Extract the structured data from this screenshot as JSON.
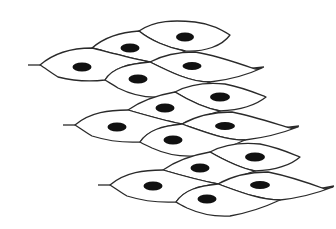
{
  "diagram": {
    "title": "",
    "colors": {
      "background": "#ffffff",
      "outline": "#2a2a2a",
      "nucleus": "#111111"
    },
    "layers": [
      {
        "name": "layer-1",
        "cells": [
          {
            "path": "M139,31 C155,20 175,20 195,22 C212,24 222,30 230,35 C222,46 205,52 185,51 C168,48 150,40 139,31 Z",
            "nucleus": [
              185,
              37,
              9,
              4.5
            ]
          },
          {
            "path": "M92,48 C106,36 122,32 139,31 C150,40 168,48 185,51 C172,58 160,62 150,62 C130,58 108,52 92,48 Z",
            "nucleus": [
              130,
              48,
              9.5,
              4.5
            ]
          },
          {
            "path": "M40,65 C55,52 75,48 92,48 C108,52 130,58 150,62 C128,64 112,68 105,80 C88,82 70,80 58,77 C50,72 45,68 40,65 Z",
            "nucleus": [
              82,
              67,
              9.5,
              4.5
            ]
          },
          {
            "path": "M150,62 C165,54 180,52 195,52 C215,55 235,62 255,69 L262,68 C245,76 228,80 210,82 C190,82 170,72 150,62 Z",
            "nucleus": [
              192,
              66,
              9.5,
              4
            ]
          },
          {
            "path": "M105,80 C112,68 128,64 150,62 C170,72 190,82 210,82 C195,90 178,95 160,97 C145,98 130,94 118,88 C112,84 108,82 105,80 Z",
            "nucleus": [
              138,
              79,
              9.5,
              4.5
            ]
          }
        ],
        "tails": [
          "M28,65 L40,65",
          "M245,69 L264,67"
        ]
      },
      {
        "name": "layer-2",
        "cells": [
          {
            "path": "M175,92 C190,84 205,82 225,84 C245,88 258,94 266,97 C255,106 240,110 220,111 C205,108 188,100 175,92 Z",
            "nucleus": [
              220,
              97,
              10,
              4.5
            ]
          },
          {
            "path": "M128,110 C142,100 158,95 175,92 C188,100 205,108 220,111 C205,116 192,120 182,124 C162,120 145,115 128,110 Z",
            "nucleus": [
              165,
              108,
              9.5,
              4.5
            ]
          },
          {
            "path": "M75,125 C90,112 110,110 128,110 C145,115 162,120 182,124 C165,126 148,130 140,142 C122,143 105,140 92,136 C85,132 80,128 75,125 Z",
            "nucleus": [
              117,
              127,
              9.5,
              4.5
            ]
          },
          {
            "path": "M182,124 C198,115 215,112 232,112 C252,116 270,122 290,128 L298,127 C280,134 262,138 245,140 C225,140 205,132 182,124 Z",
            "nucleus": [
              225,
              126,
              10,
              4
            ]
          },
          {
            "path": "M140,142 C148,130 162,126 182,124 C205,132 225,140 245,140 C228,148 212,153 195,156 C178,157 163,153 152,148 C146,145 143,144 140,142 Z",
            "nucleus": [
              173,
              140,
              9.5,
              4.5
            ]
          }
        ],
        "tails": [
          "M63,125 L75,125",
          "M282,128 L299,126"
        ]
      },
      {
        "name": "layer-3",
        "cells": [
          {
            "path": "M210,152 C225,144 240,142 260,144 C280,148 292,154 300,157 C290,166 275,170 255,171 C240,168 224,160 210,152 Z",
            "nucleus": [
              255,
              157,
              10,
              4.5
            ]
          },
          {
            "path": "M163,170 C177,160 193,155 210,152 C224,160 240,168 255,171 C240,176 228,180 218,184 C198,180 180,175 163,170 Z",
            "nucleus": [
              200,
              168,
              9.5,
              4.5
            ]
          },
          {
            "path": "M110,185 C125,172 145,170 163,170 C180,175 198,180 218,184 C200,186 184,190 176,202 C158,203 140,200 127,196 C120,192 115,188 110,185 Z",
            "nucleus": [
              153,
              186,
              9.5,
              4.5
            ]
          },
          {
            "path": "M218,184 C234,175 250,172 268,172 C288,176 306,182 325,189 L333,187 C315,194 298,198 280,200 C260,200 240,192 218,184 Z",
            "nucleus": [
              260,
              185,
              10,
              4
            ]
          },
          {
            "path": "M176,202 C184,190 198,186 218,184 C240,192 260,200 280,200 C263,208 247,213 230,216 C212,217 198,213 187,208 C181,205 179,204 176,202 Z",
            "nucleus": [
              207,
              199,
              9.5,
              4.5
            ]
          }
        ],
        "tails": [
          "M98,185 L110,185",
          "M318,189 L334,186"
        ]
      }
    ]
  }
}
